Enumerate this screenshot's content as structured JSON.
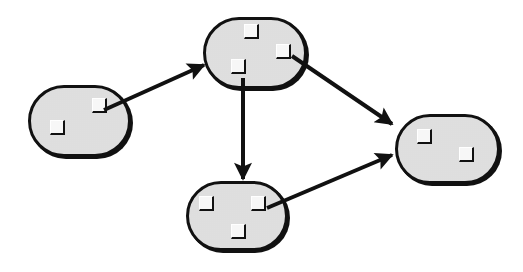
{
  "diagram": {
    "type": "directed-graph",
    "style": {
      "node_fill": "#e6e6e6",
      "node_stroke": "#111111",
      "port_fill": "#f7f7f7",
      "edge_color": "#111111",
      "background": "#ffffff"
    },
    "nodes": [
      {
        "id": "A",
        "x": 28,
        "y": 85,
        "w": 103,
        "h": 72,
        "ports": [
          {
            "id": "A1",
            "x": 64,
            "y": 13
          },
          {
            "id": "A2",
            "x": 22,
            "y": 35
          }
        ]
      },
      {
        "id": "B",
        "x": 203,
        "y": 17,
        "w": 104,
        "h": 72,
        "ports": [
          {
            "id": "B1",
            "x": 41,
            "y": 7
          },
          {
            "id": "B2",
            "x": 73,
            "y": 27
          },
          {
            "id": "B3",
            "x": 28,
            "y": 42
          }
        ]
      },
      {
        "id": "C",
        "x": 395,
        "y": 114,
        "w": 105,
        "h": 70,
        "ports": [
          {
            "id": "C1",
            "x": 22,
            "y": 15
          },
          {
            "id": "C2",
            "x": 64,
            "y": 33
          }
        ]
      },
      {
        "id": "D",
        "x": 186,
        "y": 181,
        "w": 102,
        "h": 70,
        "ports": [
          {
            "id": "D1",
            "x": 13,
            "y": 15
          },
          {
            "id": "D2",
            "x": 65,
            "y": 15
          },
          {
            "id": "D3",
            "x": 45,
            "y": 43
          }
        ]
      }
    ],
    "edges": [
      {
        "from": "A.A1",
        "to": "B",
        "x1": 104,
        "y1": 110,
        "x2": 204,
        "y2": 65
      },
      {
        "from": "B.B3",
        "to": "D",
        "x1": 243,
        "y1": 78,
        "x2": 243,
        "y2": 179
      },
      {
        "from": "B.B2",
        "to": "C",
        "x1": 292,
        "y1": 56,
        "x2": 392,
        "y2": 124
      },
      {
        "from": "D.D2",
        "to": "C",
        "x1": 267,
        "y1": 208,
        "x2": 392,
        "y2": 155
      }
    ]
  }
}
